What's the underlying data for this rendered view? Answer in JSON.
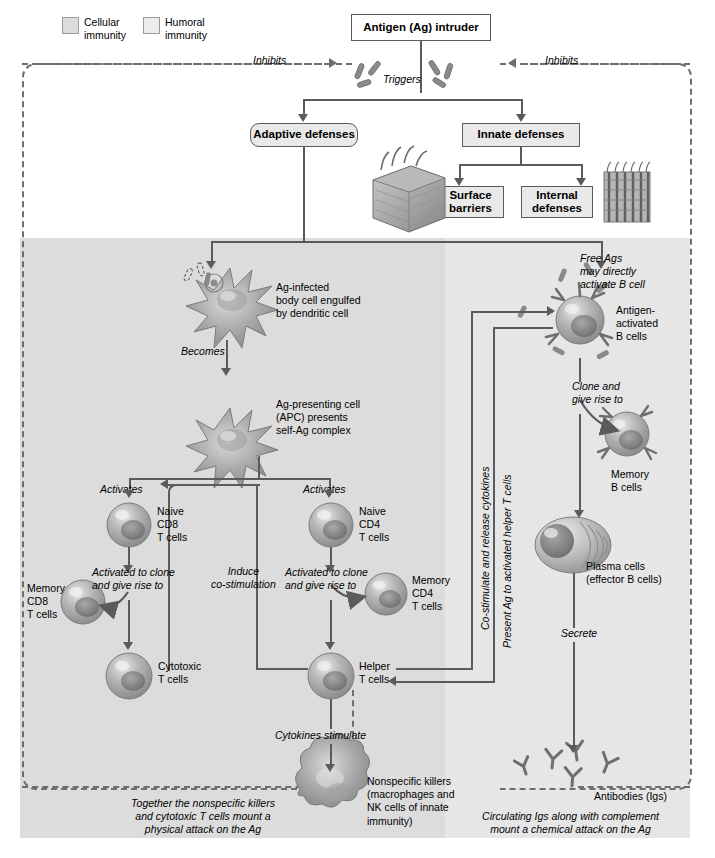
{
  "diagram": {
    "legend": [
      {
        "label": "Cellular\nimmunity",
        "color": "#dcdcdc"
      },
      {
        "label": "Humoral\nimmunity",
        "color": "#ececec"
      }
    ],
    "boxes": {
      "antigen": "Antigen (Ag) intruder",
      "adaptive": "Adaptive defenses",
      "innate": "Innate defenses",
      "surface": "Surface\nbarriers",
      "internal": "Internal\ndefenses"
    },
    "edge_labels": {
      "inhibits_left": "Inhibits",
      "inhibits_right": "Inhibits",
      "triggers": "Triggers",
      "becomes": "Becomes",
      "activates_left": "Activates",
      "activates_right": "Activates",
      "induce_costim": "Induce\nco-stimulation",
      "activated_clone_left": "Activated to clone\nand give rise to",
      "activated_clone_right": "Activated to clone\nand give rise to",
      "cytokines_stimulate": "Cytokines stimulate",
      "clone_give_rise": "Clone and\ngive rise to",
      "secrete": "Secrete",
      "costimulate_release": "Co-stimulate and release cytokines",
      "present_ag": "Present Ag to activated helper T cells"
    },
    "cell_labels": {
      "ag_infected": "Ag-infected\nbody cell engulfed\nby dendritic cell",
      "apc": "Ag-presenting cell\n(APC) presents\nself-Ag complex",
      "naive_cd8": "Naive\nCD8\nT cells",
      "naive_cd4": "Naive\nCD4\nT cells",
      "memory_cd8": "Memory\nCD8\nT cells",
      "memory_cd4": "Memory\nCD4\nT cells",
      "cytotoxic": "Cytotoxic\nT cells",
      "helper": "Helper\nT cells",
      "nonspecific": "Nonspecific killers\n(macrophages and\nNK cells of innate\nimmunity)",
      "free_ags": "Free Ags\nmay directly\nactivate B cell",
      "antigen_activated_b": "Antigen-\nactivated\nB cells",
      "memory_b": "Memory\nB cells",
      "plasma": "Plasma cells\n(effector B cells)",
      "antibodies": "Antibodies (Igs)"
    },
    "captions": {
      "left": "Together the nonspecific killers\nand cytotoxic T cells mount a\nphysical attack on the Ag",
      "right": "Circulating Igs along with complement\nmount a chemical attack on the Ag"
    },
    "colors": {
      "cellular_band": "#dcdcdc",
      "humoral_band": "#e6e6e6",
      "line": "#5b5b5b",
      "dashed": "#6e6e6e",
      "box_fill": "#e9e9e9"
    }
  }
}
